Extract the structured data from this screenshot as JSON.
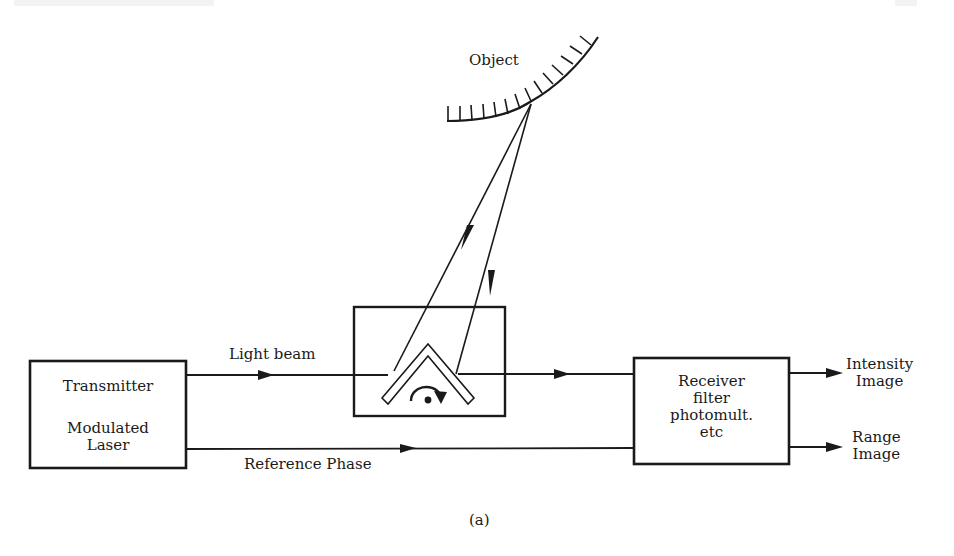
{
  "diagram": {
    "type": "block-diagram",
    "caption": "(a)",
    "object": {
      "label": "Object"
    },
    "scanner": {
      "description": "rotating mirror in box"
    },
    "blocks": {
      "transmitter": {
        "line1": "Transmitter",
        "line2": "Modulated",
        "line3": "Laser"
      },
      "receiver": {
        "line1": "Receiver",
        "line2": "filter",
        "line3": "photomult.",
        "line4": "etc"
      }
    },
    "signals": {
      "light_beam": "Light beam",
      "reference_phase": "Reference Phase"
    },
    "outputs": {
      "intensity": {
        "line1": "Intensity",
        "line2": "Image"
      },
      "range": {
        "line1": "Range",
        "line2": "Image"
      }
    }
  }
}
